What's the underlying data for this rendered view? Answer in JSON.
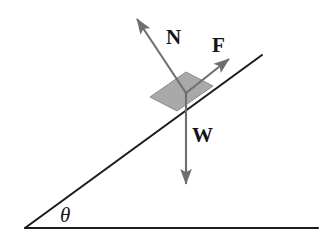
{
  "figure": {
    "name": "inclined-plane-free-body-diagram",
    "background_color": "#ffffff"
  },
  "geometry": {
    "ground_line": {
      "x1": 25,
      "y1": 228,
      "x2": 318,
      "y2": 228
    },
    "incline_line": {
      "x1": 25,
      "y1": 228,
      "x2": 262,
      "y2": 55
    },
    "incline_angle_degrees": 36,
    "block": {
      "fill_color": "#a9a9a9",
      "stroke_color": "#8c8c8c",
      "points": "150,97 186,72 213,86 177,111"
    },
    "vector_origin": {
      "x": 186,
      "y": 93
    }
  },
  "vectors": [
    {
      "id": "normal-force",
      "label": "N",
      "from": {
        "x": 186,
        "y": 93
      },
      "to": {
        "x": 137,
        "y": 19
      },
      "color": "#6e6e6e",
      "label_pos": {
        "x": 166,
        "y": 44
      }
    },
    {
      "id": "applied-force",
      "label": "F",
      "from": {
        "x": 186,
        "y": 93
      },
      "to": {
        "x": 229,
        "y": 59
      },
      "color": "#6e6e6e",
      "label_pos": {
        "x": 212,
        "y": 52
      }
    },
    {
      "id": "weight-force",
      "label": "W",
      "from": {
        "x": 186,
        "y": 93
      },
      "to": {
        "x": 186,
        "y": 184
      },
      "color": "#6e6e6e",
      "label_pos": {
        "x": 192,
        "y": 142
      }
    }
  ],
  "labels": {
    "normal": "N",
    "force": "F",
    "weight": "W",
    "angle": "θ",
    "angle_pos": {
      "x": 60,
      "y": 222
    }
  },
  "colors": {
    "line": "#1c1c1c",
    "arrow": "#6e6e6e",
    "block_fill": "#a9a9a9",
    "text": "#141414"
  }
}
